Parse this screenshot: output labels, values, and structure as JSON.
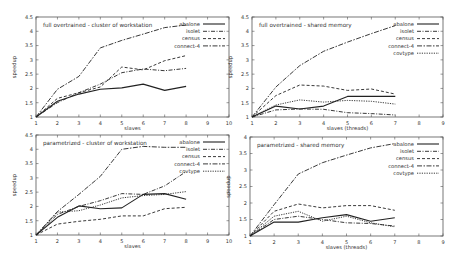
{
  "chart_data": [
    {
      "type": "line",
      "title": "full overtrained - cluster of workstation",
      "xlabel": "slaves",
      "ylabel": "speedup",
      "xlim": [
        1,
        10
      ],
      "ylim": [
        1,
        4.5
      ],
      "xticks": [
        1,
        2,
        3,
        4,
        5,
        6,
        7,
        8,
        9,
        10
      ],
      "yticks": [
        1,
        1.5,
        2,
        2.5,
        3,
        3.5,
        4,
        4.5
      ],
      "grid": false,
      "legend_position": "top-right",
      "x": [
        1,
        2,
        3,
        4,
        5,
        6,
        7,
        8
      ],
      "series": [
        {
          "name": "abalone",
          "dash": "solid",
          "values": [
            1,
            1.55,
            1.8,
            1.97,
            2.02,
            2.15,
            1.93,
            2.07
          ]
        },
        {
          "name": "isolet",
          "dash": "dashdot",
          "values": [
            1,
            1.5,
            1.85,
            2.15,
            2.55,
            2.68,
            2.62,
            2.7
          ]
        },
        {
          "name": "census",
          "dash": "dashed",
          "values": [
            1,
            1.65,
            1.85,
            2.05,
            2.75,
            2.65,
            2.97,
            3.15
          ]
        },
        {
          "name": "connect-4",
          "dash": "dashdot2",
          "values": [
            1,
            1.97,
            2.42,
            3.42,
            3.68,
            3.9,
            4.13,
            4.22
          ]
        }
      ]
    },
    {
      "type": "line",
      "title": "full overtrained - shared memory",
      "xlabel": "slaves (threads)",
      "ylabel": "speedup",
      "xlim": [
        1,
        9
      ],
      "ylim": [
        1,
        4.5
      ],
      "xticks": [
        1,
        2,
        3,
        4,
        5,
        6,
        7,
        8,
        9
      ],
      "yticks": [
        1,
        1.5,
        2,
        2.5,
        3,
        3.5,
        4,
        4.5
      ],
      "grid": false,
      "legend_position": "top-right",
      "x": [
        1,
        2,
        3,
        4,
        5,
        6,
        7
      ],
      "series": [
        {
          "name": "abalone",
          "dash": "solid",
          "values": [
            1,
            1.38,
            1.28,
            1.38,
            1.72,
            1.72,
            1.72
          ]
        },
        {
          "name": "isolet",
          "dash": "dashdot",
          "values": [
            1,
            1.25,
            1.28,
            1.27,
            1.15,
            1.12,
            1.07
          ]
        },
        {
          "name": "census",
          "dash": "dashed",
          "values": [
            1,
            1.75,
            2.12,
            2.08,
            1.93,
            1.98,
            1.8
          ]
        },
        {
          "name": "connect-4",
          "dash": "dashdot2",
          "values": [
            1,
            2.05,
            2.8,
            3.3,
            3.62,
            3.92,
            4.2
          ]
        },
        {
          "name": "covtype",
          "dash": "dotted",
          "values": [
            1,
            1.42,
            1.6,
            1.52,
            1.58,
            1.55,
            1.45
          ]
        }
      ]
    },
    {
      "type": "line",
      "title": "parametrized - cluster of workstation",
      "xlabel": "slaves",
      "ylabel": "speedup",
      "xlim": [
        1,
        10
      ],
      "ylim": [
        1,
        4.5
      ],
      "xticks": [
        1,
        2,
        3,
        4,
        5,
        6,
        7,
        8,
        9,
        10
      ],
      "yticks": [
        1,
        1.5,
        2,
        2.5,
        3,
        3.5,
        4,
        4.5
      ],
      "grid": false,
      "legend_position": "top-right",
      "x": [
        1,
        2,
        3,
        4,
        5,
        6,
        7,
        8
      ],
      "series": [
        {
          "name": "abalone",
          "dash": "solid",
          "values": [
            1,
            1.62,
            2.02,
            1.92,
            1.95,
            2.42,
            2.45,
            2.25
          ]
        },
        {
          "name": "isolet",
          "dash": "dashdot",
          "values": [
            1,
            1.72,
            2.0,
            2.2,
            2.45,
            2.42,
            2.72,
            3.22
          ]
        },
        {
          "name": "census",
          "dash": "dashed",
          "values": [
            1,
            1.38,
            1.48,
            1.55,
            1.67,
            1.67,
            1.92,
            1.97
          ]
        },
        {
          "name": "connect-4",
          "dash": "dashdot2",
          "values": [
            1,
            1.82,
            2.42,
            3.05,
            4.0,
            4.1,
            4.07,
            4.07
          ]
        },
        {
          "name": "covtype",
          "dash": "dotted",
          "values": [
            1,
            1.8,
            1.85,
            2.05,
            2.3,
            2.38,
            2.42,
            2.52
          ]
        }
      ]
    },
    {
      "type": "line",
      "title": "parametrized - shared memory",
      "xlabel": "slaves (threads)",
      "ylabel": "speedup",
      "xlim": [
        1,
        9
      ],
      "ylim": [
        1,
        4
      ],
      "xticks": [
        1,
        2,
        3,
        4,
        5,
        6,
        7,
        8,
        9
      ],
      "yticks": [
        1,
        1.5,
        2,
        2.5,
        3,
        3.5,
        4
      ],
      "grid": false,
      "legend_position": "top-right",
      "x": [
        1,
        2,
        3,
        4,
        5,
        6,
        7
      ],
      "series": [
        {
          "name": "abalone",
          "dash": "solid",
          "values": [
            1,
            1.42,
            1.42,
            1.55,
            1.65,
            1.45,
            1.55
          ]
        },
        {
          "name": "isolet",
          "dash": "dashdot",
          "values": [
            1,
            1.5,
            1.6,
            1.5,
            1.4,
            1.38,
            1.3
          ]
        },
        {
          "name": "census",
          "dash": "dashed",
          "values": [
            1,
            1.75,
            1.97,
            1.85,
            1.92,
            1.92,
            1.78
          ]
        },
        {
          "name": "connect-4",
          "dash": "dashdot2",
          "values": [
            1,
            1.95,
            2.88,
            3.22,
            3.45,
            3.67,
            3.8
          ]
        },
        {
          "name": "covtype",
          "dash": "dotted",
          "values": [
            1,
            1.6,
            1.75,
            1.45,
            1.6,
            1.4,
            1.28
          ]
        }
      ]
    }
  ],
  "layout": {
    "panels": [
      {
        "x0": 36,
        "x1": 229,
        "y0": 117,
        "y1": 17
      },
      {
        "x0": 252,
        "x1": 443,
        "y0": 117,
        "y1": 17
      },
      {
        "x0": 36,
        "x1": 229,
        "y0": 235,
        "y1": 135
      },
      {
        "x0": 250,
        "x1": 443,
        "y0": 236,
        "y1": 137
      }
    ]
  }
}
